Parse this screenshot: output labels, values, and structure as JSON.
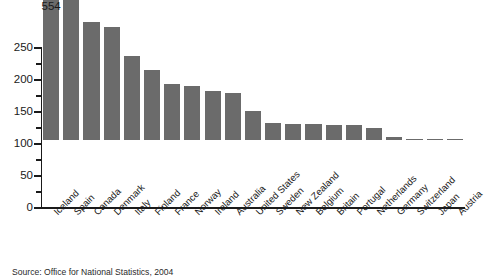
{
  "caption": "Source: Office for National Statistics, 2004",
  "axis": {
    "y_ticks": [
      "0",
      "50",
      "100",
      "150",
      "200",
      "250"
    ]
  },
  "chart_data": {
    "type": "bar",
    "title": "",
    "subtitle": "",
    "xlabel": "",
    "ylabel": "",
    "ylim": [
      0,
      250
    ],
    "grid": false,
    "legend": "none",
    "yticks": [
      0,
      50,
      100,
      150,
      200,
      250
    ],
    "minor_ticks": true,
    "broken_axis": {
      "enabled": true,
      "category": "Iceland",
      "displayed_value": 554,
      "note": "Iceland bar is truncated with a zigzag break; its true value 554 is printed above the bar."
    },
    "bar_color": "#6b6b6b",
    "categories": [
      "Iceland",
      "Spain",
      "Canada",
      "Denmark",
      "Italy",
      "Finland",
      "France",
      "Norway",
      "Ireland",
      "Australia",
      "United States",
      "Sweden",
      "New Zealand",
      "Belgium",
      "Britain",
      "Portugal",
      "Netherlands",
      "Germany",
      "Switzerland",
      "Japan",
      "Austria"
    ],
    "values": [
      554,
      244,
      185,
      177,
      131,
      110,
      88,
      84,
      77,
      74,
      46,
      26,
      25,
      25,
      24,
      23,
      19,
      4,
      2,
      1,
      0.5
    ],
    "data_labels": [
      {
        "category": "Iceland",
        "text": "554"
      }
    ]
  }
}
